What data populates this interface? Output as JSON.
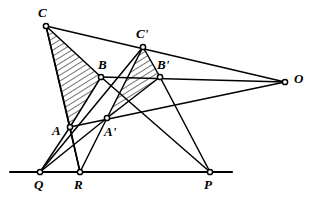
{
  "figure": {
    "stroke_color": "#000000",
    "hatch_color": "#000000",
    "background": "#ffffff",
    "vertex_fill": "#ffffff"
  },
  "points": [
    {
      "id": "C",
      "label": "C",
      "x": 46,
      "y": 26,
      "lx": 38,
      "ly": 6,
      "marker": true
    },
    {
      "id": "Cp",
      "label": "C'",
      "x": 143,
      "y": 47,
      "lx": 136,
      "ly": 27,
      "marker": true
    },
    {
      "id": "B",
      "label": "B",
      "x": 101,
      "y": 77,
      "lx": 98,
      "ly": 58,
      "marker": true
    },
    {
      "id": "Bp",
      "label": "B'",
      "x": 160,
      "y": 77,
      "lx": 157,
      "ly": 58,
      "marker": true
    },
    {
      "id": "A",
      "label": "A",
      "x": 70,
      "y": 127,
      "lx": 52,
      "ly": 124,
      "marker": true
    },
    {
      "id": "Ap",
      "label": "A'",
      "x": 107,
      "y": 118,
      "lx": 104,
      "ly": 125,
      "marker": true
    },
    {
      "id": "O",
      "label": "O",
      "x": 285,
      "y": 82,
      "lx": 294,
      "ly": 72,
      "marker": true
    },
    {
      "id": "Q",
      "label": "Q",
      "x": 40,
      "y": 172,
      "lx": 34,
      "ly": 178,
      "marker": true
    },
    {
      "id": "R",
      "label": "R",
      "x": 80,
      "y": 172,
      "lx": 74,
      "ly": 178,
      "marker": true
    },
    {
      "id": "P",
      "label": "P",
      "x": 210,
      "y": 172,
      "lx": 204,
      "ly": 178,
      "marker": true
    }
  ],
  "triangles": [
    {
      "id": "ABC",
      "name": "triangle-abc",
      "vertices": [
        "C",
        "B",
        "A"
      ],
      "hatched": true
    },
    {
      "id": "ApBpCp",
      "name": "triangle-a-b-c-prime",
      "vertices": [
        "Cp",
        "Bp",
        "Ap"
      ],
      "hatched": true
    }
  ],
  "segments": [
    {
      "name": "side-cb",
      "from": "C",
      "to": "B"
    },
    {
      "name": "side-ba",
      "from": "B",
      "to": "A"
    },
    {
      "name": "side-ac",
      "from": "A",
      "to": "C"
    },
    {
      "name": "side-cp-bp",
      "from": "Cp",
      "to": "Bp"
    },
    {
      "name": "side-bp-ap",
      "from": "Bp",
      "to": "Ap"
    },
    {
      "name": "side-ap-cp",
      "from": "Ap",
      "to": "Cp"
    },
    {
      "name": "ray-c-to-o",
      "from": "C",
      "to": "O"
    },
    {
      "name": "ray-b-to-o",
      "from": "B",
      "to": "O"
    },
    {
      "name": "ray-a-to-o",
      "from": "A",
      "to": "O"
    },
    {
      "name": "line-a-to-q",
      "from": "A",
      "to": "Q"
    },
    {
      "name": "line-a-to-r",
      "from": "A",
      "to": "R"
    },
    {
      "name": "line-ap-to-q",
      "from": "Ap",
      "to": "Q"
    },
    {
      "name": "line-ap-to-r",
      "from": "Ap",
      "to": "R"
    },
    {
      "name": "line-b-to-p",
      "from": "B",
      "to": "P"
    },
    {
      "name": "line-bp-to-p",
      "from": "Bp",
      "to": "P"
    },
    {
      "name": "line-c-to-r",
      "from": "C",
      "to": "R"
    },
    {
      "name": "line-cp-to-q",
      "from": "Cp",
      "to": "Q"
    }
  ],
  "baseline": {
    "name": "axis-of-perspectivity",
    "x1": 10,
    "y1": 172,
    "x2": 232,
    "y2": 172
  },
  "labels_note": "All point labels are italic serif capitals; primed points use a prime mark"
}
